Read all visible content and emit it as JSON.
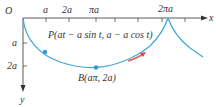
{
  "diagram": {
    "type": "cycloid-inverted",
    "colors": {
      "curve": "#3fa9dc",
      "axis": "#333333",
      "arrow": "#e0483c",
      "point": "#2b9bd6"
    },
    "axes": {
      "origin_label": "O",
      "x_label": "x",
      "y_label": "y",
      "x_ticks": [
        "a",
        "2a",
        "πa",
        "2πa"
      ],
      "y_ticks": [
        "a",
        "2a"
      ]
    },
    "points": {
      "P": {
        "label": "P(at − a sin t, a − a cos t)"
      },
      "B": {
        "label": "B(aπ, 2a)"
      }
    }
  }
}
